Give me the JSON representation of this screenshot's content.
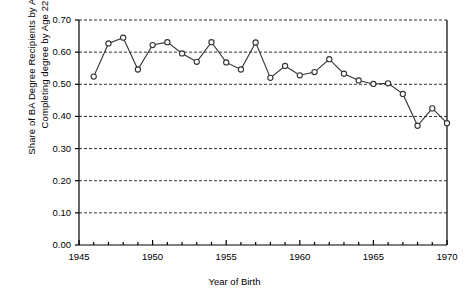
{
  "chart_data": {
    "type": "line",
    "title": "",
    "xlabel": "Year of Birth",
    "ylabel_line1": "Share of BA Degree Recipients by Age 30",
    "ylabel_line2": "Completing degree by Age 22",
    "xlim": [
      1945,
      1970
    ],
    "ylim": [
      0.0,
      0.7
    ],
    "xticks": [
      1945,
      1950,
      1955,
      1960,
      1965,
      1970
    ],
    "xtick_labels": [
      "1945",
      "1950",
      "1955",
      "1960",
      "1965",
      "1970"
    ],
    "yticks": [
      0.0,
      0.1,
      0.2,
      0.3,
      0.4,
      0.5,
      0.6,
      0.7
    ],
    "ytick_labels": [
      "0.00",
      "0.10",
      "0.20",
      "0.30",
      "0.40",
      "0.50",
      "0.60",
      "0.70"
    ],
    "xtick_minor_step": 1,
    "grid": "horizontal-dashed",
    "legend": "none",
    "marker": "open-circle",
    "line_color": "#333333",
    "marker_color": "#333333",
    "grid_color": "#333333",
    "axis_color": "#000000",
    "background": "#ffffff",
    "x": [
      1946,
      1947,
      1948,
      1949,
      1950,
      1951,
      1952,
      1953,
      1954,
      1955,
      1956,
      1957,
      1958,
      1959,
      1960,
      1961,
      1962,
      1963,
      1964,
      1965,
      1966,
      1967,
      1968,
      1969,
      1970
    ],
    "values": [
      0.524,
      0.627,
      0.645,
      0.546,
      0.622,
      0.631,
      0.596,
      0.57,
      0.631,
      0.568,
      0.546,
      0.63,
      0.52,
      0.557,
      0.528,
      0.538,
      0.578,
      0.533,
      0.512,
      0.501,
      0.503,
      0.47,
      0.371,
      0.425,
      0.379
    ],
    "series": [
      {
        "name": "Share completing BA by age 22",
        "values": [
          0.524,
          0.627,
          0.645,
          0.546,
          0.622,
          0.631,
          0.596,
          0.57,
          0.631,
          0.568,
          0.546,
          0.63,
          0.52,
          0.557,
          0.528,
          0.538,
          0.578,
          0.533,
          0.512,
          0.501,
          0.503,
          0.47,
          0.371,
          0.425,
          0.379
        ]
      }
    ]
  }
}
